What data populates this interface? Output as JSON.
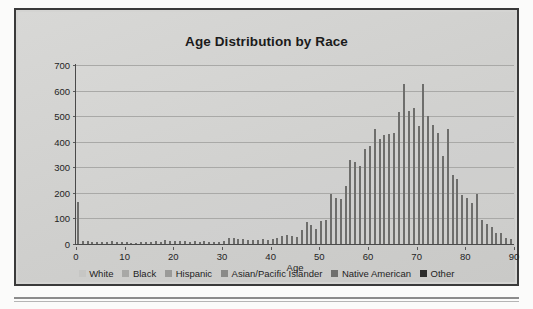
{
  "frame": {
    "border_color": "#3a3a3a",
    "background_color": "#d4d4d2"
  },
  "chart_data": {
    "type": "bar",
    "title": "Age Distribution by Race",
    "xlabel": "Age",
    "ylabel": "# of patient",
    "xlim": [
      0,
      90
    ],
    "ylim": [
      0,
      700
    ],
    "ytick_labels": [
      "0",
      "100",
      "200",
      "300",
      "400",
      "500",
      "600",
      "700"
    ],
    "yticks": [
      0,
      100,
      200,
      300,
      400,
      500,
      600,
      700
    ],
    "xtick_labels": [
      "0",
      "10",
      "20",
      "30",
      "40",
      "50",
      "60",
      "70",
      "80",
      "90"
    ],
    "xticks": [
      0,
      10,
      20,
      30,
      40,
      50,
      60,
      70,
      80,
      90
    ],
    "grid": "horizontal",
    "legend_position": "bottom",
    "bar_color": "#6e6e6c",
    "categories": [
      0,
      1,
      2,
      3,
      4,
      5,
      6,
      7,
      8,
      9,
      10,
      11,
      12,
      13,
      14,
      15,
      16,
      17,
      18,
      19,
      20,
      21,
      22,
      23,
      24,
      25,
      26,
      27,
      28,
      29,
      30,
      31,
      32,
      33,
      34,
      35,
      36,
      37,
      38,
      39,
      40,
      41,
      42,
      43,
      44,
      45,
      46,
      47,
      48,
      49,
      50,
      51,
      52,
      53,
      54,
      55,
      56,
      57,
      58,
      59,
      60,
      61,
      62,
      63,
      64,
      65,
      66,
      67,
      68,
      69,
      70,
      71,
      72,
      73,
      74,
      75,
      76,
      77,
      78,
      79,
      80,
      81,
      82,
      83,
      84,
      85,
      86,
      87,
      88,
      89
    ],
    "values": [
      165,
      12,
      10,
      9,
      8,
      8,
      7,
      10,
      6,
      6,
      6,
      5,
      5,
      6,
      7,
      8,
      10,
      9,
      14,
      10,
      10,
      10,
      11,
      9,
      10,
      9,
      10,
      9,
      8,
      7,
      11,
      22,
      22,
      20,
      18,
      16,
      16,
      14,
      20,
      17,
      18,
      25,
      30,
      35,
      32,
      28,
      55,
      85,
      75,
      60,
      90,
      95,
      195,
      180,
      175,
      225,
      330,
      320,
      305,
      370,
      385,
      450,
      410,
      425,
      430,
      435,
      515,
      625,
      520,
      530,
      460,
      625,
      500,
      465,
      435,
      345,
      450,
      270,
      255,
      190,
      180,
      160,
      195,
      95,
      80,
      65,
      45,
      45,
      25,
      20
    ],
    "legend": [
      {
        "label": "White",
        "color": "#c6c6c4"
      },
      {
        "label": "Black",
        "color": "#a8a8a6"
      },
      {
        "label": "Hispanic",
        "color": "#9a9a98"
      },
      {
        "label": "Asian/Pacific Islander",
        "color": "#8a8a88"
      },
      {
        "label": "Native American",
        "color": "#6f6f6d"
      },
      {
        "label": "Other",
        "color": "#2b2b2b"
      }
    ]
  }
}
